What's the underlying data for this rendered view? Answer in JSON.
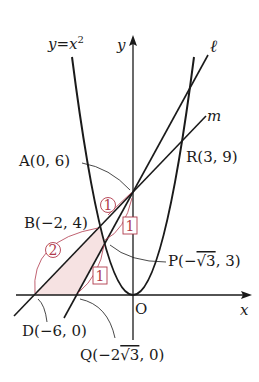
{
  "figure": {
    "curve_label": "y = x²",
    "curve_label_parts": {
      "y": "y",
      "eq": "=",
      "x": "x",
      "exp": "2"
    },
    "axis_y_label": "y",
    "axis_x_label": "x",
    "origin_label": "O",
    "line_l_label": "ℓ",
    "line_m_label": "m",
    "stray_mark": "。"
  },
  "points": {
    "A": {
      "label": "A(0, 6)",
      "x": 0,
      "y": 6
    },
    "B": {
      "label": "B(−2, 4)",
      "x": -2,
      "y": 4
    },
    "R": {
      "label": "R(3, 9)",
      "x": 3,
      "y": 9
    },
    "P": {
      "label_main": "P(−",
      "label_sqrt": "√3",
      "label_tail": ", 3)",
      "x": -1.732,
      "y": 3
    },
    "D": {
      "label": "D(−6, 0)",
      "x": -6,
      "y": 0
    },
    "Q": {
      "label_main": "Q(−2",
      "label_sqrt": "√3",
      "label_tail": ", 0)",
      "x": -3.464,
      "y": 0
    }
  },
  "ratio_annotations": {
    "circled_1": "1",
    "circled_2": "2",
    "boxed_1_upper": "1",
    "boxed_1_lower": "1"
  },
  "colors": {
    "ink": "#1a1a1a",
    "annotation": "#b03a4c",
    "shade": "#f6e2e2"
  },
  "equations": {
    "parabola": "y = x^2",
    "line_l": "y = √3 x + 6",
    "line_m": "y = x + 6"
  }
}
